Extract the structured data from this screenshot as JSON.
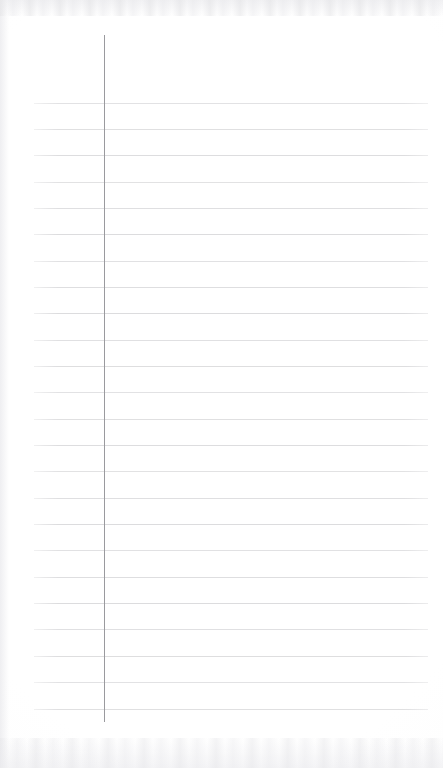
{
  "document": {
    "kind": "scanned-blank-ruled-notepad-page",
    "title": "",
    "body_text": "",
    "handwriting": "",
    "page_number": "",
    "header_text": "",
    "footer_text": ""
  },
  "canvas": {
    "width": 443,
    "height": 768,
    "background_color": "#ffffff",
    "paper_tint_color": "#fdfdfd"
  },
  "ruling": {
    "rule_color": "#dcdcde",
    "rule_thickness": 1,
    "rule_left_x": 34,
    "rule_right_x": 428,
    "first_rule_y": 103,
    "rule_spacing": 26.3,
    "rule_count": 24,
    "rule_y_positions": [
      103,
      129,
      155,
      182,
      208,
      234,
      261,
      287,
      313,
      340,
      366,
      392,
      419,
      445,
      471,
      498,
      524,
      550,
      577,
      603,
      629,
      656,
      682,
      709
    ]
  },
  "margin_rule": {
    "color": "#9a9a9e",
    "thickness": 1,
    "x": 104,
    "top_y": 35,
    "bottom_y": 722
  },
  "scan_artifacts": {
    "top_noise_band_height": 16,
    "bottom_noise_band_height": 30,
    "left_edge_shadow_width": 9,
    "noise_color": "#e9e9ec"
  }
}
